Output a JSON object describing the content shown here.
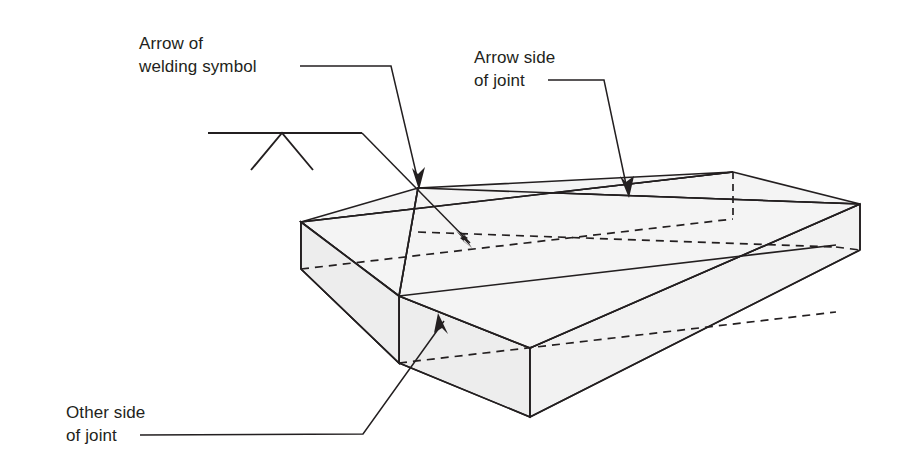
{
  "diagram": {
    "background_color": "#ffffff",
    "line_color": "#231f20",
    "plate_fill_color": "#f2f2f2",
    "plate_fill_top_color": "#f4f4f4",
    "plate_fill_side_color": "#ededed"
  },
  "labels": {
    "arrow_of_welding_symbol": {
      "line1": "Arrow of",
      "line2": "welding symbol"
    },
    "arrow_side_of_joint": {
      "line1": "Arrow side",
      "line2": "of joint"
    },
    "other_side_of_joint": {
      "line1": "Other side",
      "line2": "of joint"
    }
  },
  "icons": {
    "welding_symbol": "weld-vee-symbol-icon",
    "arrowhead": "arrowhead-icon"
  }
}
